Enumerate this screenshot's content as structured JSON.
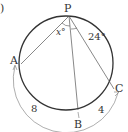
{
  "figure": {
    "corner_mark": ")",
    "points": {
      "P": {
        "label": "P",
        "x": 69,
        "y": 15
      },
      "A": {
        "label": "A",
        "x": 21,
        "y": 64
      },
      "B": {
        "label": "B",
        "x": 78,
        "y": 110
      },
      "C": {
        "label": "C",
        "x": 114,
        "y": 89
      }
    },
    "circle": {
      "cx": 66,
      "cy": 63,
      "r": 47
    },
    "angles": {
      "APB": {
        "label": "x°"
      },
      "BPC": {
        "label": "24°"
      }
    },
    "arcs": {
      "AB": {
        "label": "8"
      },
      "BC": {
        "label": "4"
      }
    },
    "colors": {
      "stroke": "#333333",
      "thin": "#555555"
    }
  }
}
